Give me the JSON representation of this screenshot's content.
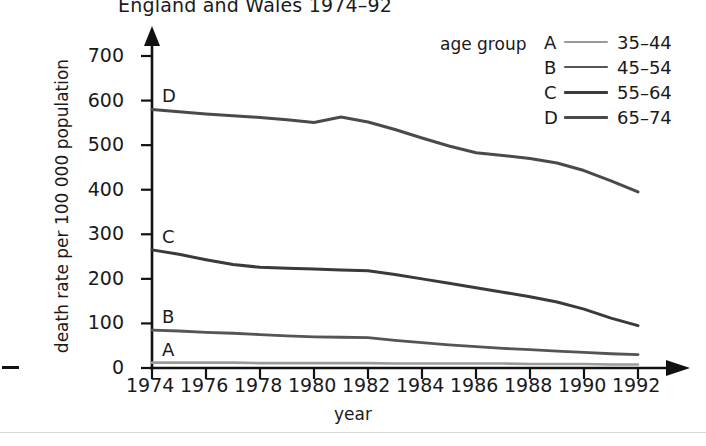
{
  "chart_data": {
    "type": "line",
    "title": "England and Wales 1974–92",
    "xlabel": "year",
    "ylabel": "death rate per 100 000 population",
    "legend_title": "age group",
    "legend_position": "top-right",
    "grid": false,
    "xlim": [
      1974,
      1992
    ],
    "ylim": [
      0,
      700
    ],
    "yticks": [
      0,
      100,
      200,
      300,
      400,
      500,
      600,
      700
    ],
    "xticks": [
      1974,
      1976,
      1978,
      1980,
      1982,
      1984,
      1986,
      1988,
      1990,
      1992
    ],
    "x": [
      1974,
      1975,
      1976,
      1977,
      1978,
      1979,
      1980,
      1981,
      1982,
      1983,
      1984,
      1985,
      1986,
      1987,
      1988,
      1989,
      1990,
      1991,
      1992
    ],
    "series": [
      {
        "key": "A",
        "name": "35–44",
        "color": "#9a9a9a",
        "width": 2.6,
        "values": [
          12,
          12,
          12,
          12,
          11,
          11,
          11,
          11,
          11,
          10,
          10,
          10,
          10,
          10,
          9,
          9,
          9,
          8,
          8
        ]
      },
      {
        "key": "B",
        "name": "45–54",
        "color": "#555555",
        "width": 2.8,
        "values": [
          85,
          83,
          80,
          78,
          75,
          72,
          70,
          69,
          68,
          62,
          57,
          52,
          48,
          44,
          41,
          38,
          35,
          32,
          30
        ]
      },
      {
        "key": "C",
        "name": "55–64",
        "color": "#3a3a3a",
        "width": 3.0,
        "values": [
          265,
          255,
          243,
          232,
          226,
          224,
          222,
          220,
          218,
          210,
          200,
          190,
          180,
          170,
          160,
          148,
          132,
          112,
          95
        ]
      },
      {
        "key": "D",
        "name": "65–74",
        "color": "#4a4a4a",
        "width": 3.0,
        "values": [
          580,
          575,
          570,
          566,
          562,
          557,
          551,
          563,
          552,
          535,
          516,
          498,
          483,
          477,
          470,
          460,
          443,
          420,
          395
        ]
      }
    ]
  },
  "legend": {
    "title": "age group",
    "entries": [
      {
        "key": "A",
        "range": "35–44"
      },
      {
        "key": "B",
        "range": "45–54"
      },
      {
        "key": "C",
        "range": "55–64"
      },
      {
        "key": "D",
        "range": "65–74"
      }
    ]
  },
  "plot_labels": [
    {
      "key": "D"
    },
    {
      "key": "C"
    },
    {
      "key": "B"
    },
    {
      "key": "A"
    }
  ]
}
